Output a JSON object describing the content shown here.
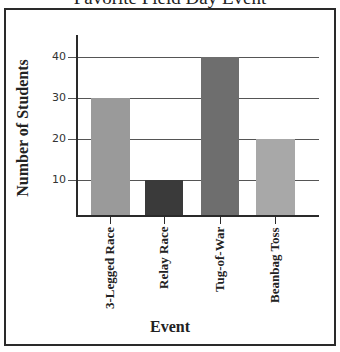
{
  "chart_data": {
    "type": "bar",
    "title": "Favorite Field Day Event",
    "categories": [
      "3-Legged Race",
      "Relay Race",
      "Tug-of-War",
      "Beanbag Toss"
    ],
    "values": [
      30,
      10,
      40,
      20
    ],
    "xlabel": "Event",
    "ylabel": "Number of Students",
    "ylim": [
      0,
      45
    ],
    "yticks": [
      10,
      20,
      30,
      40
    ],
    "grid": true,
    "legend": null,
    "bar_colors": [
      "#9a9a9a",
      "#3a3a3a",
      "#6e6e6e",
      "#a8a8a8"
    ]
  },
  "labels": {
    "title_partial": "Favorite Field Day Event",
    "ylabel": "Number of Students",
    "xlabel": "Event",
    "yticks": [
      "10",
      "20",
      "30",
      "40"
    ],
    "categories": [
      "3-Legged Race",
      "Relay Race",
      "Tug-of-War",
      "Beanbag Toss"
    ]
  }
}
